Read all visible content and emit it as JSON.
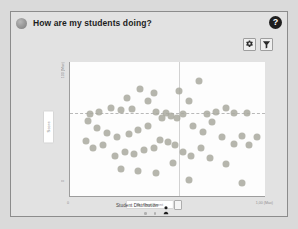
{
  "card": {
    "title": "How are my students doing?",
    "title_icon": "avatar-circle-icon",
    "help_label": "?"
  },
  "toolbar": {
    "settings_icon": "gear-icon",
    "filter_icon": "funnel-icon"
  },
  "legend": {
    "label": "Student Distribution",
    "person_icon": "person-icon",
    "square_icon": "square-swatch-icon"
  },
  "chart_data": {
    "type": "scatter",
    "title": "How are my students doing?",
    "xlabel": "Time Spent",
    "ylabel": "Score",
    "ytick_top": "100 (Max)",
    "ytick_bottom": "0",
    "xtick_left": "0",
    "xtick_right": "1,00 (Max)",
    "grid": false,
    "legend_position": "bottom",
    "xlim": [
      0,
      100
    ],
    "ylim": [
      0,
      100
    ],
    "reference_lines": {
      "horizontal_y": 62,
      "vertical_x": 56
    },
    "series": [
      {
        "name": "Student Distribution",
        "color": "#a9a99f",
        "points": [
          [
            36,
            80
          ],
          [
            43,
            77
          ],
          [
            29,
            73
          ],
          [
            40,
            71
          ],
          [
            21,
            66
          ],
          [
            26,
            64
          ],
          [
            32,
            65
          ],
          [
            44,
            63
          ],
          [
            49,
            62
          ],
          [
            56,
            78
          ],
          [
            61,
            71
          ],
          [
            66,
            86
          ],
          [
            70,
            61
          ],
          [
            75,
            63
          ],
          [
            80,
            66
          ],
          [
            84,
            62
          ],
          [
            91,
            62
          ],
          [
            15,
            63
          ],
          [
            10,
            61
          ],
          [
            52,
            60
          ],
          [
            55,
            58
          ],
          [
            58,
            61
          ],
          [
            47,
            58
          ],
          [
            40,
            52
          ],
          [
            35,
            49
          ],
          [
            30,
            46
          ],
          [
            24,
            44
          ],
          [
            19,
            47
          ],
          [
            14,
            51
          ],
          [
            9,
            56
          ],
          [
            63,
            52
          ],
          [
            68,
            48
          ],
          [
            73,
            55
          ],
          [
            78,
            44
          ],
          [
            88,
            45
          ],
          [
            96,
            44
          ],
          [
            46,
            42
          ],
          [
            50,
            40
          ],
          [
            54,
            38
          ],
          [
            43,
            36
          ],
          [
            38,
            34
          ],
          [
            33,
            31
          ],
          [
            28,
            33
          ],
          [
            23,
            30
          ],
          [
            58,
            33
          ],
          [
            62,
            30
          ],
          [
            67,
            36
          ],
          [
            72,
            28
          ],
          [
            84,
            39
          ],
          [
            92,
            38
          ],
          [
            26,
            20
          ],
          [
            35,
            19
          ],
          [
            44,
            17
          ],
          [
            53,
            25
          ],
          [
            61,
            12
          ],
          [
            17,
            38
          ],
          [
            12,
            36
          ],
          [
            8,
            41
          ],
          [
            80,
            24
          ],
          [
            88,
            10
          ]
        ]
      }
    ]
  },
  "pager": {
    "dots": 2
  }
}
